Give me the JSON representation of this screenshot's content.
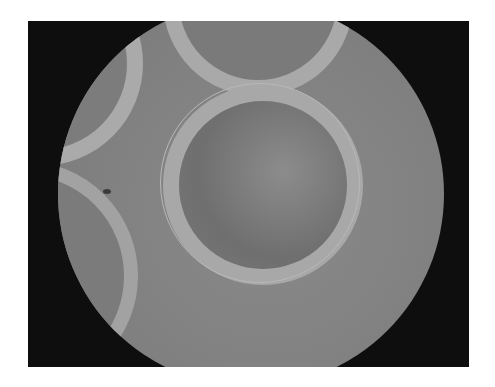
{
  "image": {
    "type": "micrograph",
    "description": "Grayscale circular microscope field of view showing circular wells with bright rims",
    "colors": {
      "background": "#ffffff",
      "frame": "#0e0e0e",
      "field": "#808080",
      "ring": "#a8a8a8"
    },
    "elements": [
      {
        "name": "main-well",
        "position": "center"
      },
      {
        "name": "top-well",
        "position": "top, partially cut"
      },
      {
        "name": "left-well",
        "position": "upper-left, partially cut"
      },
      {
        "name": "bottom-left-well",
        "position": "lower-left, partially cut"
      }
    ]
  }
}
